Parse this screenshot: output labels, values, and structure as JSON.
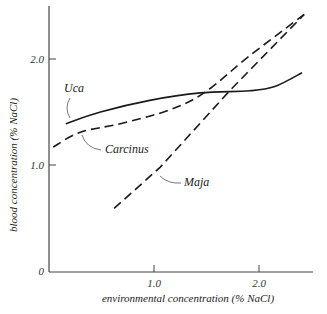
{
  "chart_data": {
    "type": "line",
    "title": "",
    "xlabel": "environmental concentration (% NaCl)",
    "ylabel": "blood concentration (% NaCl)",
    "xlim": [
      0,
      2.5
    ],
    "ylim": [
      0,
      2.5
    ],
    "x_ticks": [
      {
        "value": 1.0,
        "label": "1.0"
      },
      {
        "value": 2.0,
        "label": "2.0"
      }
    ],
    "y_ticks": [
      {
        "value": 0,
        "label": "0"
      },
      {
        "value": 1.0,
        "label": "1.0"
      },
      {
        "value": 2.0,
        "label": "2.0"
      }
    ],
    "grid": false,
    "legend": "inline labels with leader lines",
    "series": [
      {
        "name": "Uca",
        "style": "solid",
        "x": [
          0.16,
          0.49,
          0.96,
          1.44,
          1.91,
          2.15,
          2.41
        ],
        "y": [
          1.39,
          1.5,
          1.61,
          1.68,
          1.7,
          1.74,
          1.87
        ]
      },
      {
        "name": "Carcinus",
        "style": "dashed",
        "x": [
          0.04,
          0.3,
          0.68,
          1.15,
          1.49,
          1.91,
          2.43
        ],
        "y": [
          1.17,
          1.31,
          1.39,
          1.52,
          1.69,
          2.03,
          2.42
        ]
      },
      {
        "name": "Maja",
        "style": "dashed",
        "x": [
          0.62,
          1.06,
          1.72,
          2.43
        ],
        "y": [
          0.59,
          0.98,
          1.7,
          2.42
        ]
      }
    ],
    "annotations": [
      {
        "text": "Uca",
        "x": 0.25,
        "y": 1.72
      },
      {
        "text": "Carcinus",
        "x": 0.95,
        "y": 1.18
      },
      {
        "text": "Maja",
        "x": 1.45,
        "y": 0.62
      }
    ]
  }
}
